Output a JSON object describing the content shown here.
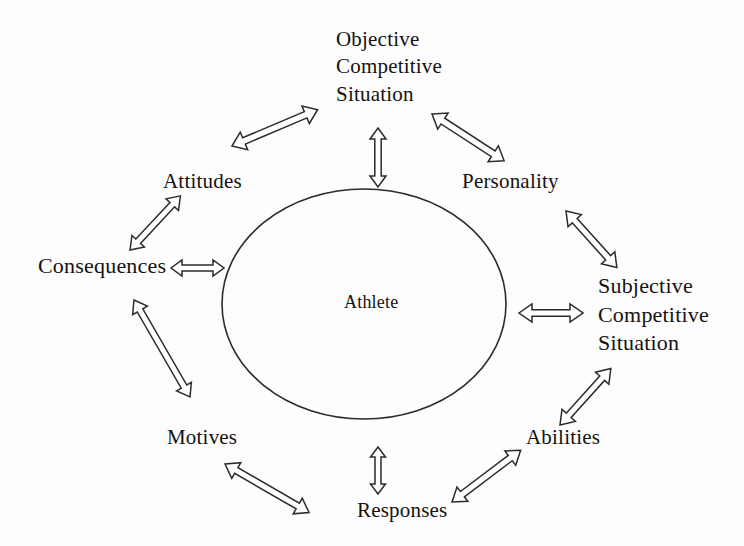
{
  "figure": {
    "background_color": "#fdfdfd",
    "stroke_color": "#2b2b2b",
    "text_color": "#15120f"
  },
  "center": {
    "label": "Athlete",
    "shape": "ellipse",
    "cx": 364,
    "cy": 304,
    "rx": 142,
    "ry": 115
  },
  "nodes": [
    {
      "id": "objective",
      "label": "Objective Competitive Situation",
      "lines": [
        "Objective",
        "Competitive",
        "Situation"
      ],
      "x": 336,
      "y": 26,
      "align": "left"
    },
    {
      "id": "personality",
      "label": "Personality",
      "lines": [
        "Personality"
      ],
      "x": 462,
      "y": 168,
      "align": "left"
    },
    {
      "id": "subjective",
      "label": "Subjective Competitive Situation",
      "lines": [
        "Subjective",
        "Competitive",
        "Situation"
      ],
      "x": 598,
      "y": 272,
      "align": "left"
    },
    {
      "id": "abilities",
      "label": "Abilities",
      "lines": [
        "Abilities"
      ],
      "x": 526,
      "y": 424,
      "align": "left"
    },
    {
      "id": "responses",
      "label": "Responses",
      "lines": [
        "Responses"
      ],
      "x": 357,
      "y": 497,
      "align": "left"
    },
    {
      "id": "motives",
      "label": "Motives",
      "lines": [
        "Motives"
      ],
      "x": 167,
      "y": 424,
      "align": "left"
    },
    {
      "id": "consequences",
      "label": "Consequences",
      "lines": [
        "Consequences"
      ],
      "x": 38,
      "y": 252,
      "align": "left"
    },
    {
      "id": "attitudes",
      "label": "Attitudes",
      "lines": [
        "Attitudes"
      ],
      "x": 163,
      "y": 168,
      "align": "left"
    }
  ],
  "connectors": [
    {
      "id": "objective-to-athlete",
      "from": "objective",
      "to": "athlete",
      "style": "double-arrow-hollow",
      "orientation": "vertical"
    },
    {
      "id": "attitudes-to-objective",
      "from": "attitudes",
      "to": "objective",
      "style": "double-arrow-hollow",
      "orientation": "diagonal"
    },
    {
      "id": "objective-to-personality",
      "from": "objective",
      "to": "personality",
      "style": "double-arrow-hollow",
      "orientation": "diagonal"
    },
    {
      "id": "personality-to-subjective",
      "from": "personality",
      "to": "subjective",
      "style": "double-arrow-hollow",
      "orientation": "diagonal"
    },
    {
      "id": "subjective-to-athlete",
      "from": "subjective",
      "to": "athlete",
      "style": "double-arrow-hollow",
      "orientation": "horizontal"
    },
    {
      "id": "subjective-to-abilities",
      "from": "subjective",
      "to": "abilities",
      "style": "double-arrow-hollow",
      "orientation": "diagonal"
    },
    {
      "id": "abilities-to-responses",
      "from": "abilities",
      "to": "responses",
      "style": "double-arrow-hollow",
      "orientation": "diagonal"
    },
    {
      "id": "responses-to-athlete",
      "from": "responses",
      "to": "athlete",
      "style": "double-arrow-hollow",
      "orientation": "vertical"
    },
    {
      "id": "motives-to-responses",
      "from": "motives",
      "to": "responses",
      "style": "double-arrow-hollow",
      "orientation": "diagonal"
    },
    {
      "id": "consequences-to-motives",
      "from": "consequences",
      "to": "motives",
      "style": "double-arrow-hollow",
      "orientation": "diagonal"
    },
    {
      "id": "consequences-to-athlete",
      "from": "consequences",
      "to": "athlete",
      "style": "double-arrow-hollow",
      "orientation": "horizontal"
    },
    {
      "id": "consequences-to-attitudes",
      "from": "consequences",
      "to": "attitudes",
      "style": "double-arrow-hollow",
      "orientation": "diagonal"
    }
  ]
}
